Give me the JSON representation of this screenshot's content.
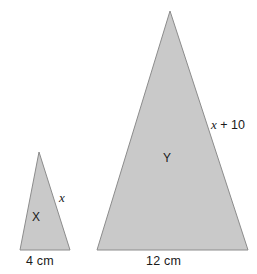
{
  "figure": {
    "background_color": "#ffffff",
    "shape_fill_color": "#c9c9c9",
    "shape_stroke_color": "#8c8c8c",
    "text_color": "#1a1a1a"
  },
  "shapes": [
    {
      "name": "triangle-x",
      "inner_label": "X",
      "side_label": "x",
      "base_label": "4 cm",
      "points": "39,152 70,250 20,250"
    },
    {
      "name": "triangle-y",
      "inner_label": "Y",
      "side_label": "x + 10",
      "base_label": "12 cm",
      "points": "170,11 248,250 97,250"
    }
  ],
  "labels": {
    "x_side": "x",
    "x_inner": "X",
    "x_base": "4 cm",
    "y_side_var": "x",
    "y_side_rest": " + 10",
    "y_inner": "Y",
    "y_base": "12 cm"
  }
}
